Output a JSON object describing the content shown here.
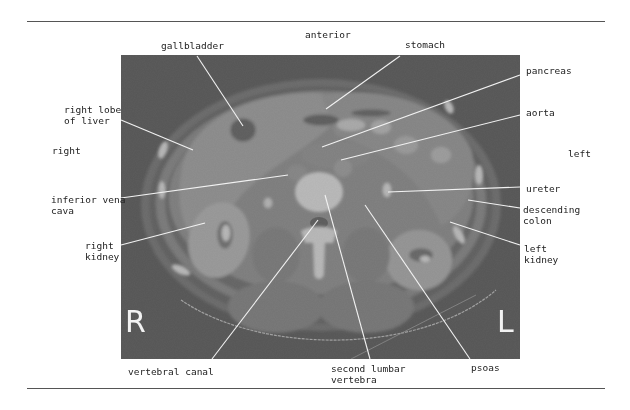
{
  "figure": {
    "type": "axial CT scan, abdomen at level of second lumbar vertebra",
    "orientation": {
      "top": "anterior",
      "left_side": "right",
      "right_side": "left",
      "marker_left": "R",
      "marker_right": "L"
    },
    "labels": [
      {
        "id": "gallbladder",
        "text": "gallbladder"
      },
      {
        "id": "anterior",
        "text": "anterior"
      },
      {
        "id": "stomach",
        "text": "stomach"
      },
      {
        "id": "pancreas",
        "text": "pancreas"
      },
      {
        "id": "right-lobe-of-liver",
        "text": "right lobe\nof liver"
      },
      {
        "id": "aorta",
        "text": "aorta"
      },
      {
        "id": "right",
        "text": "right"
      },
      {
        "id": "left",
        "text": "left"
      },
      {
        "id": "inferior-vena-cava",
        "text": "inferior vena\ncava"
      },
      {
        "id": "ureter",
        "text": "ureter"
      },
      {
        "id": "descending-colon",
        "text": "descending\ncolon"
      },
      {
        "id": "right-kidney",
        "text": "right\nkidney"
      },
      {
        "id": "left-kidney",
        "text": "left\nkidney"
      },
      {
        "id": "vertebral-canal",
        "text": "vertebral canal"
      },
      {
        "id": "second-lumbar-vertebra",
        "text": "second lumbar\nvertebra"
      },
      {
        "id": "psoas",
        "text": "psoas"
      }
    ]
  },
  "colors": {
    "rule": "#555555",
    "leader": "#f2f2f2",
    "background": "#0c0c0c",
    "text": "#222222"
  }
}
